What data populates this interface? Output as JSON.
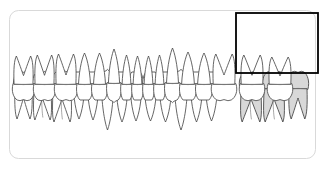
{
  "view": {
    "title": "Dental Arch Chart",
    "width": 323,
    "height": 170,
    "background_color": "#ffffff",
    "card_fill": "#ffffff",
    "card_border_color": "#d9d9d9",
    "card_corner_radius": 9
  },
  "style": {
    "tooth_outline_color": "#4a4a4a",
    "tooth_fill_color": "#ffffff",
    "selected_tooth_fill_color": "#d8d8d8",
    "cej_line_color": "#7a7a7a",
    "selection_box_color": "#000000",
    "selection_box_width": 1.8
  },
  "selection": {
    "name": "upper-right-posterior-selection",
    "label": "",
    "arch": "upper",
    "tooth_count": 3,
    "shaded": true,
    "box": {
      "x": 236,
      "y": 13,
      "width": 82,
      "height": 60
    }
  },
  "arches": [
    {
      "id": "upper",
      "name": "upper-arch",
      "label": "Upper arch",
      "tooth_count": 16,
      "root_direction": "up",
      "occlusal_y": 72,
      "teeth": [
        {
          "index": 0,
          "type": "molar",
          "roots": 2,
          "x": 14,
          "width": 19,
          "crown_h": 17,
          "root_h": 30,
          "selected": false
        },
        {
          "index": 1,
          "type": "molar",
          "roots": 3,
          "x": 33,
          "width": 19,
          "crown_h": 17,
          "root_h": 31,
          "selected": false
        },
        {
          "index": 2,
          "type": "molar",
          "roots": 3,
          "x": 52,
          "width": 20,
          "crown_h": 17,
          "root_h": 33,
          "selected": false
        },
        {
          "index": 3,
          "type": "premolar",
          "roots": 1,
          "x": 72,
          "width": 14,
          "crown_h": 16,
          "root_h": 31,
          "selected": false
        },
        {
          "index": 4,
          "type": "premolar",
          "roots": 1,
          "x": 86,
          "width": 14,
          "crown_h": 16,
          "root_h": 32,
          "selected": false
        },
        {
          "index": 5,
          "type": "canine",
          "roots": 1,
          "x": 100,
          "width": 15,
          "crown_h": 18,
          "root_h": 40,
          "selected": false
        },
        {
          "index": 6,
          "type": "incisor",
          "roots": 1,
          "x": 115,
          "width": 14,
          "crown_h": 19,
          "root_h": 31,
          "selected": false
        },
        {
          "index": 7,
          "type": "incisor",
          "roots": 1,
          "x": 129,
          "width": 14,
          "crown_h": 19,
          "root_h": 30,
          "selected": false
        },
        {
          "index": 8,
          "type": "incisor",
          "roots": 1,
          "x": 143,
          "width": 15,
          "crown_h": 19,
          "root_h": 30,
          "selected": false
        },
        {
          "index": 9,
          "type": "incisor",
          "roots": 1,
          "x": 158,
          "width": 15,
          "crown_h": 19,
          "root_h": 31,
          "selected": false
        },
        {
          "index": 10,
          "type": "canine",
          "roots": 1,
          "x": 173,
          "width": 16,
          "crown_h": 18,
          "root_h": 40,
          "selected": false
        },
        {
          "index": 11,
          "type": "premolar",
          "roots": 1,
          "x": 189,
          "width": 15,
          "crown_h": 17,
          "root_h": 33,
          "selected": false
        },
        {
          "index": 12,
          "type": "premolar",
          "roots": 1,
          "x": 204,
          "width": 15,
          "crown_h": 17,
          "root_h": 32,
          "selected": false
        },
        {
          "index": 13,
          "type": "molar",
          "roots": 3,
          "x": 240,
          "width": 22,
          "crown_h": 17,
          "root_h": 33,
          "selected": true
        },
        {
          "index": 14,
          "type": "molar",
          "roots": 3,
          "x": 263,
          "width": 22,
          "crown_h": 17,
          "root_h": 33,
          "selected": true
        },
        {
          "index": 15,
          "type": "molar",
          "roots": 2,
          "x": 288,
          "width": 20,
          "crown_h": 17,
          "root_h": 30,
          "selected": true
        }
      ]
    },
    {
      "id": "lower",
      "name": "lower-arch",
      "label": "Lower arch",
      "tooth_count": 16,
      "root_direction": "down",
      "occlusal_y": 100,
      "teeth": [
        {
          "index": 0,
          "type": "molar",
          "roots": 2,
          "x": 13,
          "width": 21,
          "crown_h": 16,
          "root_h": 28,
          "selected": false
        },
        {
          "index": 1,
          "type": "molar",
          "roots": 2,
          "x": 34,
          "width": 21,
          "crown_h": 16,
          "root_h": 29,
          "selected": false
        },
        {
          "index": 2,
          "type": "molar",
          "roots": 2,
          "x": 55,
          "width": 22,
          "crown_h": 16,
          "root_h": 30,
          "selected": false
        },
        {
          "index": 3,
          "type": "premolar",
          "roots": 1,
          "x": 77,
          "width": 15,
          "crown_h": 16,
          "root_h": 31,
          "selected": false
        },
        {
          "index": 4,
          "type": "premolar",
          "roots": 1,
          "x": 92,
          "width": 15,
          "crown_h": 16,
          "root_h": 31,
          "selected": false
        },
        {
          "index": 5,
          "type": "canine",
          "roots": 1,
          "x": 107,
          "width": 14,
          "crown_h": 17,
          "root_h": 34,
          "selected": false
        },
        {
          "index": 6,
          "type": "incisor",
          "roots": 1,
          "x": 121,
          "width": 11,
          "crown_h": 16,
          "root_h": 29,
          "selected": false
        },
        {
          "index": 7,
          "type": "incisor",
          "roots": 1,
          "x": 132,
          "width": 11,
          "crown_h": 16,
          "root_h": 28,
          "selected": false
        },
        {
          "index": 8,
          "type": "incisor",
          "roots": 1,
          "x": 143,
          "width": 11,
          "crown_h": 16,
          "root_h": 28,
          "selected": false
        },
        {
          "index": 9,
          "type": "incisor",
          "roots": 1,
          "x": 154,
          "width": 11,
          "crown_h": 16,
          "root_h": 29,
          "selected": false
        },
        {
          "index": 10,
          "type": "canine",
          "roots": 1,
          "x": 165,
          "width": 15,
          "crown_h": 17,
          "root_h": 35,
          "selected": false
        },
        {
          "index": 11,
          "type": "premolar",
          "roots": 1,
          "x": 180,
          "width": 16,
          "crown_h": 16,
          "root_h": 32,
          "selected": false
        },
        {
          "index": 12,
          "type": "premolar",
          "roots": 1,
          "x": 196,
          "width": 16,
          "crown_h": 16,
          "root_h": 31,
          "selected": false
        },
        {
          "index": 13,
          "type": "molar",
          "roots": 2,
          "x": 212,
          "width": 24,
          "crown_h": 16,
          "root_h": 30,
          "selected": false
        },
        {
          "index": 14,
          "type": "molar",
          "roots": 2,
          "x": 240,
          "width": 24,
          "crown_h": 16,
          "root_h": 29,
          "selected": false
        },
        {
          "index": 15,
          "type": "molar",
          "roots": 2,
          "x": 268,
          "width": 24,
          "crown_h": 16,
          "root_h": 27,
          "selected": false
        }
      ]
    }
  ]
}
